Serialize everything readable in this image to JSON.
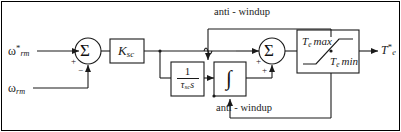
{
  "diagram": {
    "type": "control-block-diagram",
    "stroke_color": "#1a1a1a",
    "background_color": "#ffffff",
    "border_color": "#000000"
  },
  "inputs": {
    "reference": {
      "symbol": "ω",
      "subscript": "rm",
      "superscript": "*"
    },
    "feedback": {
      "symbol": "ω",
      "subscript": "rm",
      "superscript": ""
    }
  },
  "output": {
    "torque_command": {
      "symbol": "T",
      "subscript": "e",
      "superscript": "*"
    }
  },
  "summing_junctions": [
    {
      "name": "error-summer",
      "glyph": "Σ",
      "signs": {
        "top_input": "+",
        "bottom_input": "−"
      }
    },
    {
      "name": "pi-summer",
      "glyph": "Σ",
      "signs": {
        "left_input": "+",
        "bottom_input": "+"
      }
    }
  ],
  "blocks": {
    "gain": {
      "name": "proportional-gain",
      "symbol": "K",
      "subscript": "sc"
    },
    "time_constant": {
      "name": "integral-time-constant",
      "numerator": "1",
      "denominator_symbol": "τ",
      "denominator_subscript": "sc",
      "denominator_variable": "s"
    },
    "integrator": {
      "name": "integrator",
      "glyph": "∫"
    },
    "saturation": {
      "name": "torque-limiter",
      "upper_limit": {
        "symbol": "T",
        "subscript": "e",
        "text": "max"
      },
      "lower_limit": {
        "symbol": "T",
        "subscript": "e",
        "text": "min"
      }
    }
  },
  "annotations": {
    "anti_windup_top": "anti - windup",
    "anti_windup_bottom": "anti - windup"
  }
}
